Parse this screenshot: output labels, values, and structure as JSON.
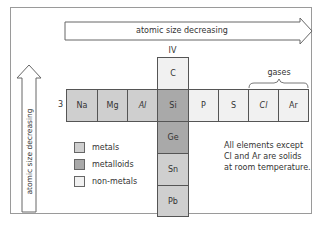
{
  "diagram": {
    "horizontal_arrow": {
      "label": "atomic size decreasing",
      "direction": "right"
    },
    "vertical_arrow": {
      "label": "atomic size decreasing",
      "direction": "up"
    },
    "group_label": "IV",
    "period_label": "3",
    "gases_label": "gases",
    "period3": [
      {
        "symbol": "Na",
        "type": "metal"
      },
      {
        "symbol": "Mg",
        "type": "metal"
      },
      {
        "symbol": "Al",
        "type": "metal"
      },
      {
        "symbol": "Si",
        "type": "metalloid"
      },
      {
        "symbol": "P",
        "type": "non-metal"
      },
      {
        "symbol": "S",
        "type": "non-metal"
      },
      {
        "symbol": "Cl",
        "type": "non-metal"
      },
      {
        "symbol": "Ar",
        "type": "non-metal"
      }
    ],
    "group4": [
      {
        "symbol": "C",
        "type": "non-metal"
      },
      {
        "symbol": "Si",
        "type": "metalloid"
      },
      {
        "symbol": "Ge",
        "type": "metalloid"
      },
      {
        "symbol": "Sn",
        "type": "metal"
      },
      {
        "symbol": "Pb",
        "type": "metal"
      }
    ],
    "legend": [
      {
        "label": "metals",
        "color": "#cfcfcf"
      },
      {
        "label": "metalloids",
        "color": "#a9a9a9"
      },
      {
        "label": "non-metals",
        "color": "#f1f1f1"
      }
    ],
    "note": [
      "All elements except",
      "Cl and Ar are solids",
      "at room temperature."
    ]
  }
}
